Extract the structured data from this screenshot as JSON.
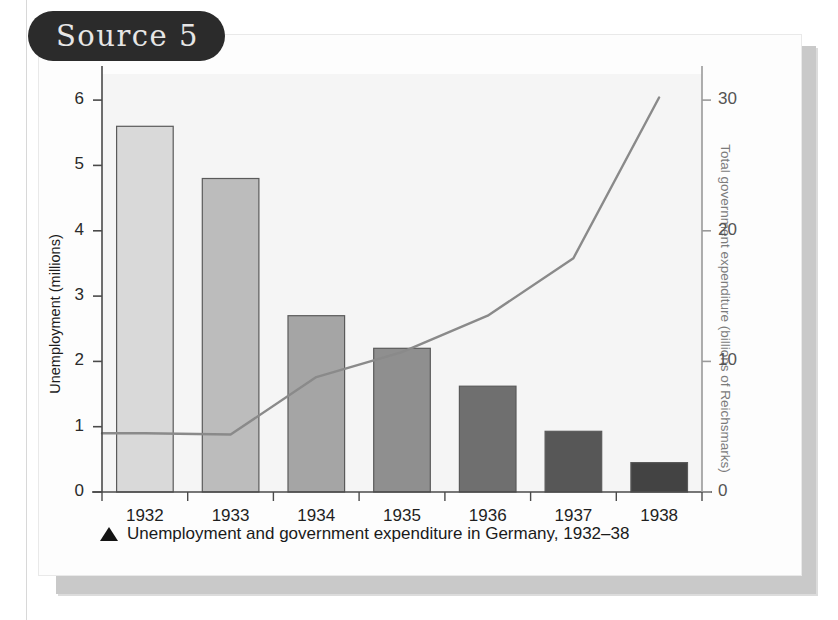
{
  "source_badge": {
    "label": "Source 5"
  },
  "caption": {
    "marker_icon": "up-triangle-icon",
    "text": "Unemployment and government expenditure in Germany, 1932–38"
  },
  "colors": {
    "badge_background": "#2b2b2b",
    "badge_text": "#e6e6e6",
    "card_background": "#fdfdfd",
    "plot_background": "#f7f7f7",
    "axis": "#4a4a4a",
    "right_axis": "#9a9a9a",
    "line_series": "#8a8a8a",
    "bar_outline": "#5a5a5a",
    "shadow": "#c9c9c9"
  },
  "chart_data": {
    "type": "bar",
    "title": "Unemployment and government expenditure in Germany, 1932–38",
    "xlabel": "",
    "categories": [
      "1932",
      "1933",
      "1934",
      "1935",
      "1936",
      "1937",
      "1938"
    ],
    "grid": false,
    "legend": "none",
    "axes": {
      "left": {
        "label": "Unemployment (millions)",
        "ticks": [
          "0",
          "1",
          "2",
          "3",
          "4",
          "5",
          "6"
        ],
        "tick_values": [
          0,
          1,
          2,
          3,
          4,
          5,
          6
        ],
        "range": [
          0,
          6.4
        ],
        "units": "millions"
      },
      "right": {
        "label": "Total government expenditure (billions of Reichsmarks)",
        "ticks": [
          "0",
          "10",
          "20",
          "30"
        ],
        "tick_values": [
          0,
          10,
          20,
          30
        ],
        "range": [
          0,
          32
        ],
        "units": "billions of Reichsmarks"
      }
    },
    "series": [
      {
        "name": "Unemployment (millions)",
        "type": "bar",
        "axis": "left",
        "values": [
          5.6,
          4.8,
          2.7,
          2.2,
          1.62,
          0.93,
          0.45
        ],
        "bar_colors": [
          "#d9d9d9",
          "#bcbcbc",
          "#a5a5a5",
          "#8f8f8f",
          "#6f6f6f",
          "#575757",
          "#434343"
        ]
      },
      {
        "name": "Total government expenditure (billions of Reichsmarks)",
        "type": "line",
        "axis": "right",
        "values": [
          4.5,
          4.4,
          8.8,
          10.7,
          13.5,
          17.9,
          30.2
        ]
      }
    ]
  }
}
